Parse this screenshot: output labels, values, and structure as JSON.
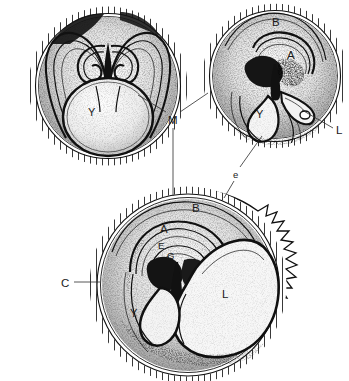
{
  "figure": {
    "kind": "anatomical-plate",
    "style": "stippled line engraving, black ink on white",
    "background_color": "#ffffff",
    "ink_color": "#111111",
    "panel_count": 3
  },
  "panels": [
    {
      "id": "panel-top-left",
      "name": "stage-1",
      "position": "top-left",
      "shape": "circular section with segmented shell rim",
      "labels": [
        {
          "id": "y-tl",
          "text": "Y",
          "x": 88,
          "y": 116,
          "meaning": "yolk-sac"
        }
      ]
    },
    {
      "id": "panel-top-right",
      "name": "stage-2",
      "position": "top-right",
      "shape": "circular section with segmented shell rim",
      "labels": [
        {
          "id": "b-tr",
          "text": "B",
          "x": 272,
          "y": 26,
          "meaning": "extraembryonic-cavity"
        },
        {
          "id": "a-tr",
          "text": "A",
          "x": 287,
          "y": 59,
          "meaning": "amniotic-cavity"
        },
        {
          "id": "y-tr",
          "text": "Y",
          "x": 256,
          "y": 118,
          "meaning": "yolk-sac"
        }
      ]
    },
    {
      "id": "panel-bottom",
      "name": "stage-3",
      "position": "bottom-center",
      "shape": "large circular section with villous (spiky) outer margin",
      "labels": [
        {
          "id": "b-b",
          "text": "B",
          "x": 192,
          "y": 212,
          "meaning": "extraembryonic-cavity"
        },
        {
          "id": "a-b",
          "text": "A",
          "x": 160,
          "y": 233,
          "meaning": "amniotic-cavity"
        },
        {
          "id": "e-b",
          "text": "E",
          "x": 158,
          "y": 249,
          "meaning": "embryo"
        },
        {
          "id": "g-b",
          "text": "G",
          "x": 167,
          "y": 259,
          "meaning": "gut"
        },
        {
          "id": "y-b",
          "text": "Y",
          "x": 130,
          "y": 317,
          "meaning": "yolk-sac"
        },
        {
          "id": "l-b",
          "text": "L",
          "x": 222,
          "y": 298,
          "meaning": "allantois"
        }
      ]
    }
  ],
  "callouts": [
    {
      "id": "callout-m",
      "text": "M",
      "x": 172,
      "y": 120,
      "meaning": "shell-membrane",
      "leader_count": 3,
      "targets": [
        "panel-top-left",
        "panel-top-right",
        "panel-bottom"
      ]
    },
    {
      "id": "callout-l",
      "text": "L",
      "x": 338,
      "y": 131,
      "meaning": "allantois",
      "leader_count": 1,
      "targets": [
        "panel-top-right"
      ]
    },
    {
      "id": "callout-e",
      "text": "e",
      "x": 236,
      "y": 175,
      "meaning": "exocoel",
      "leader_count": 1,
      "targets": [
        "panel-top-right",
        "panel-bottom"
      ]
    },
    {
      "id": "callout-c",
      "text": "C",
      "x": 64,
      "y": 285,
      "meaning": "chorion",
      "leader_count": 1,
      "targets": [
        "panel-bottom"
      ]
    }
  ],
  "legend_keys": [
    {
      "letter": "A",
      "meaning": "amniotic cavity"
    },
    {
      "letter": "B",
      "meaning": "extraembryonic coelom"
    },
    {
      "letter": "C",
      "meaning": "chorion"
    },
    {
      "letter": "E",
      "meaning": "embryo"
    },
    {
      "letter": "G",
      "meaning": "gut"
    },
    {
      "letter": "L",
      "meaning": "allantois"
    },
    {
      "letter": "M",
      "meaning": "shell membrane"
    },
    {
      "letter": "Y",
      "meaning": "yolk sac"
    },
    {
      "letter": "e",
      "meaning": "exocoel"
    }
  ]
}
